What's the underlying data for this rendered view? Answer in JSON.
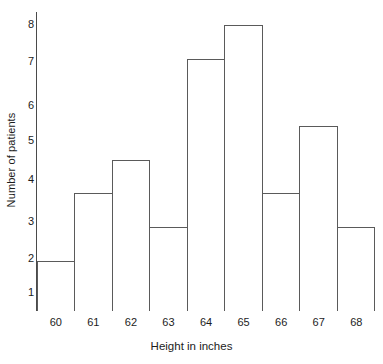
{
  "chart_data": {
    "type": "bar",
    "title": "",
    "xlabel": "Height in inches",
    "ylabel": "Number of patients",
    "categories": [
      "60",
      "61",
      "62",
      "63",
      "64",
      "65",
      "66",
      "67",
      "68"
    ],
    "values": [
      1.5,
      3.5,
      4.5,
      2.5,
      7.5,
      8.5,
      3.5,
      5.5,
      2.5
    ],
    "yticks": [
      "8",
      "7",
      "6",
      "5",
      "4",
      "3",
      "2",
      "1"
    ],
    "ytick_values": [
      8,
      7,
      6,
      5,
      4,
      3,
      2,
      1
    ],
    "ylim": [
      0,
      9
    ],
    "xlim_labels": [
      "60",
      "68"
    ],
    "grid": false,
    "legend": false,
    "bar_fill_color": "#ffffff",
    "bar_edge_color": "#5a5a5a",
    "axis_color": "#4a4a4a",
    "background_color": "#ffffff"
  }
}
